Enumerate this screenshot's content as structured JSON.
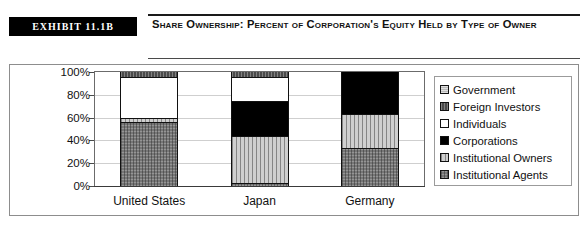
{
  "header": {
    "exhibit_tag": "Exhibit 11.1b",
    "title": "Share Ownership: Percent of Corporation's Equity Held by Type of Owner"
  },
  "chart_data": {
    "type": "bar",
    "stacked": true,
    "stack_mode": "percent",
    "title": "Share Ownership: Percent of Corporation's Equity Held by Type of Owner",
    "xlabel": "",
    "ylabel": "",
    "ylim": [
      0,
      100
    ],
    "ytick_labels": [
      "100%",
      "80%",
      "60%",
      "40%",
      "20%",
      "0%"
    ],
    "ytick_values": [
      100,
      80,
      60,
      40,
      20,
      0
    ],
    "grid": true,
    "legend_position": "right",
    "categories": [
      "United States",
      "Japan",
      "Germany"
    ],
    "series": [
      {
        "name": "Government",
        "key": "government",
        "swatch": "light-gray-hatch",
        "values": [
          0,
          0,
          0
        ]
      },
      {
        "name": "Foreign Investors",
        "key": "foreign",
        "swatch": "dark-gray-hatch",
        "values": [
          4,
          4,
          0
        ]
      },
      {
        "name": "Individuals",
        "key": "individuals",
        "swatch": "white",
        "values": [
          36,
          21,
          0
        ]
      },
      {
        "name": "Corporations",
        "key": "corporations",
        "swatch": "black",
        "values": [
          0,
          31,
          37
        ]
      },
      {
        "name": "Institutional Owners",
        "key": "instowners",
        "swatch": "light-vertical-hatch",
        "values": [
          4,
          41,
          30
        ]
      },
      {
        "name": "Institutional Agents",
        "key": "instagents",
        "swatch": "medium-gray-hatch",
        "values": [
          56,
          3,
          33
        ]
      }
    ]
  },
  "legend": {
    "items": [
      {
        "label": "Government"
      },
      {
        "label": "Foreign Investors"
      },
      {
        "label": "Individuals"
      },
      {
        "label": "Corporations"
      },
      {
        "label": "Institutional Owners"
      },
      {
        "label": "Institutional Agents"
      }
    ]
  },
  "axis": {
    "y_labels": [
      "100%",
      "80%",
      "60%",
      "40%",
      "20%",
      "0%"
    ],
    "x_labels": [
      "United States",
      "Japan",
      "Germany"
    ]
  }
}
